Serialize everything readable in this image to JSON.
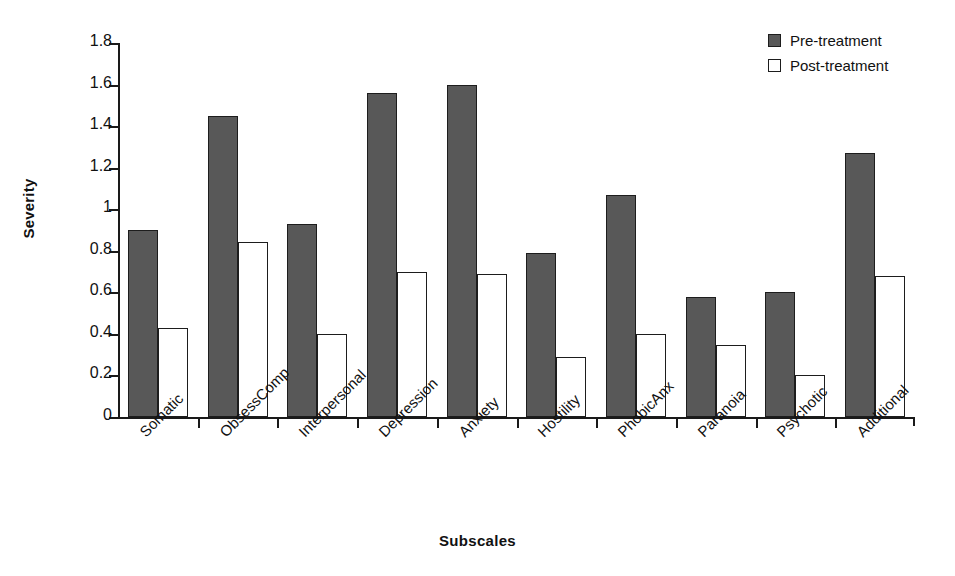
{
  "chart_data": {
    "type": "bar",
    "title": "",
    "xlabel": "Subscales",
    "ylabel": "Severity",
    "ylim": [
      0,
      1.8
    ],
    "ytick_labels": [
      "1.8",
      "1.6",
      "1.4",
      "1.2",
      "1",
      "0.8",
      "0.6",
      "0.4",
      "0.2",
      "0"
    ],
    "ytick_values": [
      1.8,
      1.6,
      1.4,
      1.2,
      1.0,
      0.8,
      0.6,
      0.4,
      0.2,
      0
    ],
    "grid": false,
    "legend_position": "top-right",
    "categories": [
      "Somatic",
      "ObsessComp",
      "Interpersonal",
      "Depression",
      "Anxiety",
      "Hostility",
      "PhobicAnx",
      "Paranoia",
      "Psychotic",
      "Additional"
    ],
    "series": [
      {
        "name": "Pre-treatment",
        "color": "#585858",
        "values": [
          0.9,
          1.45,
          0.93,
          1.56,
          1.6,
          0.79,
          1.07,
          0.58,
          0.6,
          1.27
        ]
      },
      {
        "name": "Post-treatment",
        "color": "#ffffff",
        "values": [
          0.43,
          0.84,
          0.4,
          0.7,
          0.69,
          0.29,
          0.4,
          0.345,
          0.2,
          0.68
        ]
      }
    ]
  },
  "legend": {
    "items": [
      {
        "label": "Pre-treatment",
        "style": "pre"
      },
      {
        "label": "Post-treatment",
        "style": "post"
      }
    ]
  },
  "axes": {
    "y_title": "Severity",
    "x_title": "Subscales"
  }
}
